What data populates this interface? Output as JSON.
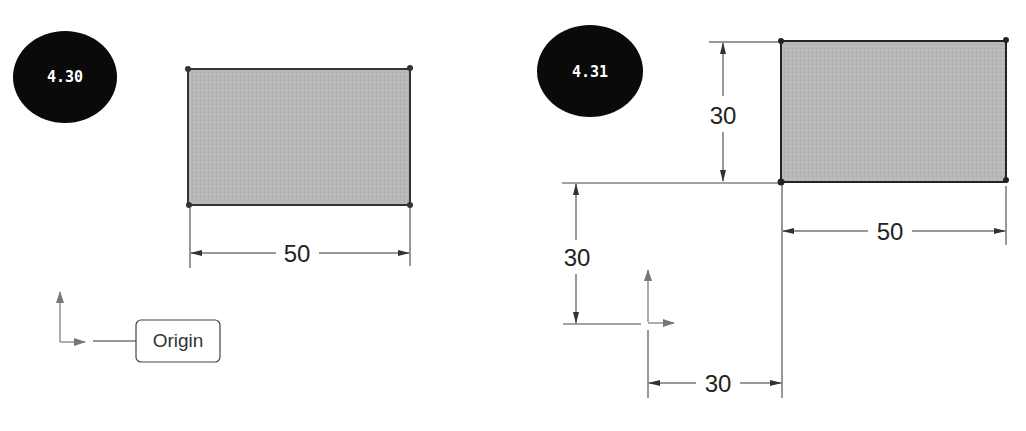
{
  "figures": [
    {
      "badge": "4.30",
      "rectangle": {
        "fill": "#b5b5b5",
        "stroke": "#333333"
      },
      "dimensions": [
        {
          "orientation": "horizontal",
          "value": "50"
        }
      ],
      "origin_label": "Origin"
    },
    {
      "badge": "4.31",
      "rectangle": {
        "fill": "#b5b5b5",
        "stroke": "#333333"
      },
      "dimensions": [
        {
          "orientation": "vertical",
          "value": "30",
          "position": "rectangle-height"
        },
        {
          "orientation": "vertical",
          "value": "30",
          "position": "origin-to-corner-y"
        },
        {
          "orientation": "horizontal",
          "value": "30",
          "position": "origin-to-corner-x"
        },
        {
          "orientation": "horizontal",
          "value": "50",
          "position": "rectangle-width"
        }
      ]
    }
  ],
  "colors": {
    "badge_bg": "#0a0a0a",
    "badge_text": "#ffffff",
    "line": "#333333",
    "origin_arrow": "#666666"
  }
}
